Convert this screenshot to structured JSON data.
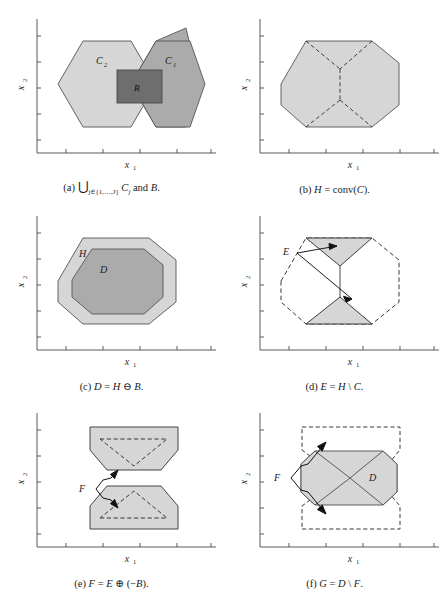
{
  "figure": {
    "panel_count": 6,
    "background_color": "#ffffff",
    "colors": {
      "light_gray": "#d6d6d6",
      "mid_gray": "#ababab",
      "dark_gray": "#6e6e6e",
      "axis": "#5a5a5a",
      "outline": "#4d4d4d",
      "dashed": "#3a3a3a"
    }
  },
  "axes": {
    "xlabel": "x₁",
    "ylabel": "x₂",
    "xlabel_plain": "x1",
    "ylabel_plain": "x2",
    "grid": false,
    "ticks_visible": true,
    "tick_labels": []
  },
  "panels": [
    {
      "id": "a",
      "tag": "(a)",
      "caption": "(a) ⋃ⱼ₊ⱼ Cⱼ and B.",
      "caption_parts": {
        "tag": "(a)",
        "union_symbol": "⋃",
        "union_subscript": "j∈{1,…,J}",
        "body": "C",
        "body_subscript": "j",
        "conjunction": "and",
        "second_set": "B",
        "period": "."
      },
      "xlabel": "x₁",
      "ylabel": "x₂",
      "shapes": [
        {
          "name": "hexagon-C2",
          "label": "C₂",
          "label_text": "C",
          "label_sub": "2",
          "fill": "#d6d6d6"
        },
        {
          "name": "hexagon-C1",
          "label": "C₁",
          "label_text": "C",
          "label_sub": "1",
          "fill": "#ababab"
        },
        {
          "name": "square-B",
          "label": "B",
          "label_text": "B",
          "label_sub": "",
          "fill": "#6e6e6e"
        }
      ]
    },
    {
      "id": "b",
      "tag": "(b)",
      "caption": "(b) H = conv(C).",
      "caption_parts": {
        "tag": "(b)",
        "lhs": "H",
        "eq": "=",
        "fn": "conv(",
        "arg": "C",
        "close": ").",
        "period": ""
      },
      "xlabel": "x₁",
      "ylabel": "x₂",
      "shapes": [
        {
          "name": "octagon-H",
          "label": "",
          "label_text": "",
          "label_sub": "",
          "fill": "#d6d6d6"
        }
      ]
    },
    {
      "id": "c",
      "tag": "(c)",
      "caption": "(c) D = H ⊖ B.",
      "caption_parts": {
        "tag": "(c)",
        "lhs": "D",
        "eq": "=",
        "rhs1": "H",
        "op": "⊖",
        "rhs2": "B",
        "period": "."
      },
      "xlabel": "x₁",
      "ylabel": "x₂",
      "shapes": [
        {
          "name": "octagon-H-outer",
          "label": "H",
          "label_text": "H",
          "label_sub": "",
          "fill": "#d6d6d6"
        },
        {
          "name": "octagon-D-inner",
          "label": "D",
          "label_text": "D",
          "label_sub": "",
          "fill": "#ababab"
        }
      ]
    },
    {
      "id": "d",
      "tag": "(d)",
      "caption": "(d) E = H \\ C.",
      "caption_parts": {
        "tag": "(d)",
        "lhs": "E",
        "eq": "=",
        "rhs1": "H",
        "op": "\\",
        "rhs2": "C",
        "period": "."
      },
      "xlabel": "x₁",
      "ylabel": "x₂",
      "annotation_label": "E",
      "shapes": [
        {
          "name": "triangle-E-top",
          "label": "",
          "label_text": "",
          "label_sub": "",
          "fill": "#d6d6d6"
        },
        {
          "name": "triangle-E-bottom",
          "label": "",
          "label_text": "",
          "label_sub": "",
          "fill": "#d6d6d6"
        },
        {
          "name": "octagon-H-dashed",
          "label": "",
          "label_text": "",
          "label_sub": "",
          "fill": "none"
        }
      ]
    },
    {
      "id": "e",
      "tag": "(e)",
      "caption": "(e) F = E ⊕ (−B).",
      "caption_parts": {
        "tag": "(e)",
        "lhs": "F",
        "eq": "=",
        "rhs1": "E",
        "op": "⊕",
        "open": "(−",
        "rhs2": "B",
        "close": ").",
        "period": ""
      },
      "xlabel": "x₁",
      "ylabel": "x₂",
      "annotation_label": "F",
      "shapes": [
        {
          "name": "dilated-F-top",
          "label": "",
          "label_text": "",
          "label_sub": "",
          "fill": "#d6d6d6"
        },
        {
          "name": "dilated-F-bottom",
          "label": "",
          "label_text": "",
          "label_sub": "",
          "fill": "#d6d6d6"
        },
        {
          "name": "triangle-E-top-dashed",
          "label": "",
          "label_text": "",
          "label_sub": "",
          "fill": "none"
        },
        {
          "name": "triangle-E-bottom-dashed",
          "label": "",
          "label_text": "",
          "label_sub": "",
          "fill": "none"
        }
      ]
    },
    {
      "id": "f",
      "tag": "(f)",
      "caption": "(f) G = D \\ F.",
      "caption_parts": {
        "tag": "(f)",
        "lhs": "G",
        "eq": "=",
        "rhs1": "D",
        "op": "\\",
        "rhs2": "F",
        "period": "."
      },
      "xlabel": "x₁",
      "ylabel": "x₂",
      "annotation_label": "F",
      "shapes": [
        {
          "name": "octagon-D",
          "label": "D",
          "label_text": "D",
          "label_sub": "",
          "fill": "#d6d6d6"
        },
        {
          "name": "rect-F-top-dashed",
          "label": "",
          "label_text": "",
          "label_sub": "",
          "fill": "none"
        },
        {
          "name": "rect-F-bottom-dashed",
          "label": "",
          "label_text": "",
          "label_sub": "",
          "fill": "none"
        }
      ]
    }
  ]
}
